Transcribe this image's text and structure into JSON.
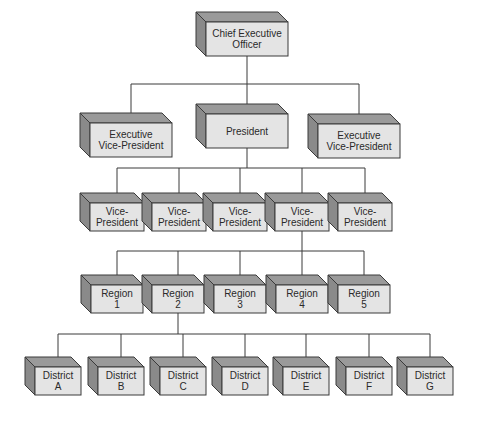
{
  "diagram": {
    "type": "org-chart",
    "colors": {
      "front_face": "#e4e4e4",
      "top_face": "#9a9a9a",
      "side_face": "#8a8a8a",
      "outline": "#3a3a3a",
      "text": "#2a2a2a",
      "background": "#ffffff"
    },
    "nodes": [
      {
        "id": "ceo",
        "lines": [
          "Chief Executive",
          "Officer"
        ],
        "x": 206,
        "y": 22,
        "w": 82,
        "h": 34,
        "d": 10
      },
      {
        "id": "evp1",
        "lines": [
          "Executive",
          "Vice-President"
        ],
        "x": 90,
        "y": 123,
        "w": 82,
        "h": 34,
        "d": 10
      },
      {
        "id": "pres",
        "lines": [
          "President"
        ],
        "x": 206,
        "y": 114,
        "w": 82,
        "h": 34,
        "d": 10
      },
      {
        "id": "evp2",
        "lines": [
          "Executive",
          "Vice-President"
        ],
        "x": 318,
        "y": 124,
        "w": 82,
        "h": 34,
        "d": 10
      },
      {
        "id": "vp1",
        "lines": [
          "Vice-",
          "President"
        ],
        "x": 90,
        "y": 203,
        "w": 54,
        "h": 28,
        "d": 10
      },
      {
        "id": "vp2",
        "lines": [
          "Vice-",
          "President"
        ],
        "x": 152,
        "y": 203,
        "w": 54,
        "h": 28,
        "d": 10
      },
      {
        "id": "vp3",
        "lines": [
          "Vice-",
          "President"
        ],
        "x": 213,
        "y": 203,
        "w": 54,
        "h": 28,
        "d": 10
      },
      {
        "id": "vp4",
        "lines": [
          "Vice-",
          "President"
        ],
        "x": 275,
        "y": 203,
        "w": 54,
        "h": 28,
        "d": 10
      },
      {
        "id": "vp5",
        "lines": [
          "Vice-",
          "President"
        ],
        "x": 338,
        "y": 203,
        "w": 54,
        "h": 28,
        "d": 10
      },
      {
        "id": "r1",
        "lines": [
          "Region",
          "1"
        ],
        "x": 91,
        "y": 285,
        "w": 52,
        "h": 28,
        "d": 10
      },
      {
        "id": "r2",
        "lines": [
          "Region",
          "2"
        ],
        "x": 152,
        "y": 285,
        "w": 52,
        "h": 28,
        "d": 10
      },
      {
        "id": "r3",
        "lines": [
          "Region",
          "3"
        ],
        "x": 214,
        "y": 285,
        "w": 52,
        "h": 28,
        "d": 10
      },
      {
        "id": "r4",
        "lines": [
          "Region",
          "4"
        ],
        "x": 276,
        "y": 285,
        "w": 52,
        "h": 28,
        "d": 10
      },
      {
        "id": "r5",
        "lines": [
          "Region",
          "5"
        ],
        "x": 338,
        "y": 285,
        "w": 52,
        "h": 28,
        "d": 10
      },
      {
        "id": "dA",
        "lines": [
          "District",
          "A"
        ],
        "x": 35,
        "y": 367,
        "w": 46,
        "h": 28,
        "d": 10
      },
      {
        "id": "dB",
        "lines": [
          "District",
          "B"
        ],
        "x": 98,
        "y": 367,
        "w": 46,
        "h": 28,
        "d": 10
      },
      {
        "id": "dC",
        "lines": [
          "District",
          "C"
        ],
        "x": 160,
        "y": 367,
        "w": 46,
        "h": 28,
        "d": 10
      },
      {
        "id": "dD",
        "lines": [
          "District",
          "D"
        ],
        "x": 222,
        "y": 367,
        "w": 46,
        "h": 28,
        "d": 10
      },
      {
        "id": "dE",
        "lines": [
          "District",
          "E"
        ],
        "x": 283,
        "y": 367,
        "w": 46,
        "h": 28,
        "d": 10
      },
      {
        "id": "dF",
        "lines": [
          "District",
          "F"
        ],
        "x": 346,
        "y": 367,
        "w": 46,
        "h": 28,
        "d": 10
      },
      {
        "id": "dG",
        "lines": [
          "District",
          "G"
        ],
        "x": 407,
        "y": 367,
        "w": 46,
        "h": 28,
        "d": 10
      }
    ],
    "edges": [
      {
        "from": "ceo",
        "children": [
          "evp1",
          "pres",
          "evp2"
        ],
        "bus_y": 84
      },
      {
        "from": "pres",
        "children": [
          "vp1",
          "vp2",
          "vp3",
          "vp4",
          "vp5"
        ],
        "bus_y": 168
      },
      {
        "from": "vp4",
        "children": [
          "r1",
          "r2",
          "r3",
          "r4",
          "r5"
        ],
        "bus_y": 251
      },
      {
        "from": "r2",
        "children": [
          "dA",
          "dB",
          "dC",
          "dD",
          "dE",
          "dF",
          "dG"
        ],
        "bus_y": 334
      }
    ]
  }
}
